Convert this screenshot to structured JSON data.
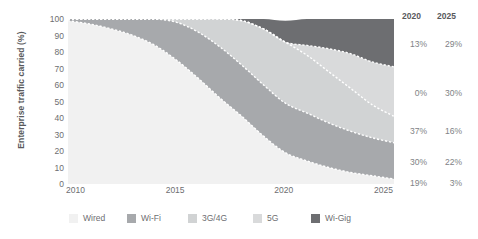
{
  "chart_data": {
    "type": "area",
    "stacked": true,
    "title": "",
    "subtitle": "",
    "xlabel": "",
    "ylabel": "Enterprise traffic carried (%)",
    "xlim": [
      2010,
      2025
    ],
    "ylim": [
      0,
      100
    ],
    "grid": false,
    "legend_position": "bottom",
    "x_tick_labels": [
      "2010",
      "2015",
      "2020",
      "2025"
    ],
    "x_ticks": [
      2010,
      2015,
      2020,
      2025
    ],
    "y_tick_labels": [
      "100",
      "90",
      "80",
      "70",
      "60",
      "50",
      "40",
      "30",
      "20",
      "10",
      "0"
    ],
    "y_ticks": [
      100,
      90,
      80,
      70,
      60,
      50,
      40,
      30,
      20,
      10,
      0
    ],
    "x": [
      2010,
      2011,
      2012,
      2013,
      2014,
      2015,
      2016,
      2017,
      2018,
      2019,
      2020,
      2021,
      2022,
      2023,
      2024,
      2025
    ],
    "series": [
      {
        "name": "Wired",
        "color": "#f1f1f1",
        "values": [
          99,
          97,
          94,
          90,
          84,
          75,
          64,
          52,
          41,
          29,
          19,
          14,
          10,
          7,
          5,
          3
        ]
      },
      {
        "name": "Wi-Fi",
        "color": "#a7a9ac",
        "values": [
          1,
          3,
          6,
          10,
          16,
          23,
          28,
          31,
          31,
          31,
          30,
          29,
          27,
          25,
          23,
          22
        ]
      },
      {
        "name": "3G/4G",
        "color": "#d1d3d4",
        "values": [
          0,
          0,
          0,
          0,
          0,
          2,
          8,
          17,
          27,
          34,
          37,
          35,
          31,
          26,
          20,
          16
        ]
      },
      {
        "name": "5G",
        "color": "#d9dadb",
        "values": [
          0,
          0,
          0,
          0,
          0,
          0,
          0,
          0,
          0,
          0,
          0,
          6,
          14,
          21,
          26,
          30
        ]
      },
      {
        "name": "Wi-Gig",
        "color": "#6d6e71",
        "values": [
          0,
          0,
          0,
          0,
          0,
          0,
          0,
          0,
          1,
          6,
          13,
          16,
          18,
          21,
          26,
          29
        ]
      }
    ],
    "boundary_line_color": "#ffffff",
    "boundary_line_style": "dashed"
  },
  "axis": {
    "y_title": "Enterprise traffic carried (%)",
    "y_ticks": [
      "100",
      "90",
      "80",
      "70",
      "60",
      "50",
      "40",
      "30",
      "20",
      "10",
      "0"
    ],
    "x_ticks": [
      "2010",
      "2015",
      "2020",
      "2025"
    ]
  },
  "right_columns": {
    "headers": [
      "2020",
      "2025"
    ],
    "rows": [
      {
        "series": "Wi-Gig",
        "v2020": "13%",
        "v2025": "29%"
      },
      {
        "series": "5G",
        "v2020": "0%",
        "v2025": "30%"
      },
      {
        "series": "3G/4G",
        "v2020": "37%",
        "v2025": "16%"
      },
      {
        "series": "Wi-Fi",
        "v2020": "30%",
        "v2025": "22%"
      },
      {
        "series": "Wired",
        "v2020": "19%",
        "v2025": "3%"
      }
    ]
  },
  "legend": {
    "items": [
      {
        "label": "Wired",
        "color": "#f1f1f1"
      },
      {
        "label": "Wi-Fi",
        "color": "#a7a9ac"
      },
      {
        "label": "3G/4G",
        "color": "#d1d3d4"
      },
      {
        "label": "5G",
        "color": "#d9dadb"
      },
      {
        "label": "Wi-Gig",
        "color": "#6d6e71"
      }
    ]
  }
}
